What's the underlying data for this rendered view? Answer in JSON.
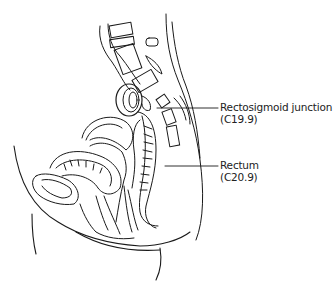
{
  "diagram": {
    "type": "anatomical-illustration",
    "labels": [
      {
        "id": "rectosigmoid",
        "name": "Rectosigmoid junction",
        "code": "(C19.9)"
      },
      {
        "id": "rectum",
        "name": "Rectum",
        "code": "(C20.9)"
      }
    ]
  }
}
